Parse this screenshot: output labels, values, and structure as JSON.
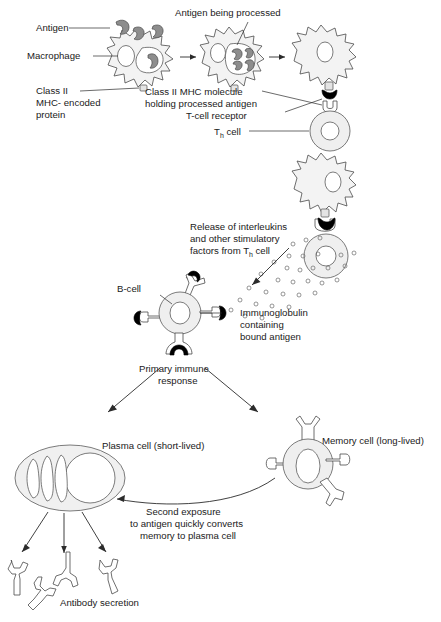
{
  "figure": {
    "colors": {
      "outline": "#4a4a4a",
      "cell_fill": "#f3f3f3",
      "antigen_gray": "#8d8d8d",
      "antigen_dark": "#000000",
      "text": "#1a1a1a",
      "background": "#ffffff"
    }
  },
  "labels": {
    "antigen": "Antigen",
    "macrophage": "Macrophage",
    "class_ii_line1": "Class II",
    "class_ii_line2": "MHC- encoded",
    "class_ii_line3": "protein",
    "antigen_being_processed": "Antigen being processed",
    "mhc_holding_line1": "Class II MHC molecule",
    "mhc_holding_line2": "holding processed antigen",
    "t_cell_receptor": "T-cell receptor",
    "th_cell_pre": "T",
    "th_cell_sub": "h",
    "th_cell_post": " cell",
    "release_line1": "Release of interleukins",
    "release_line2": "and other stimulatory",
    "release_line3_pre": "factors from T",
    "release_line3_sub": "h",
    "release_line3_post": " cell",
    "b_cell": "B-cell",
    "immunoglobulin_line1": "Immunoglobulin",
    "immunoglobulin_line2": "containing",
    "immunoglobulin_line3": "bound antigen",
    "primary_line1": "Primary immune",
    "primary_line2": "response",
    "plasma_cell": "Plasma cell (short-lived)",
    "memory_cell": "Memory cell (long-lived)",
    "second_exposure_line1": "Second exposure",
    "second_exposure_line2": "to antigen quickly converts",
    "second_exposure_line3": "memory to plasma cell",
    "antibody_secretion": "Antibody secretion"
  },
  "stages": [
    {
      "name": "macrophage-engulfing-antigen",
      "step": 1
    },
    {
      "name": "macrophage-processing-antigen",
      "step": 2
    },
    {
      "name": "macrophage-presenting-mhc",
      "step": 3
    },
    {
      "name": "th-cell-activation",
      "step": 4
    },
    {
      "name": "interleukin-release",
      "step": 5
    },
    {
      "name": "b-cell-activation",
      "step": 6
    },
    {
      "name": "primary-immune-response",
      "step": 7
    },
    {
      "name": "plasma-cell-and-memory-cell",
      "step": 8
    },
    {
      "name": "antibody-secretion",
      "step": 9
    }
  ]
}
